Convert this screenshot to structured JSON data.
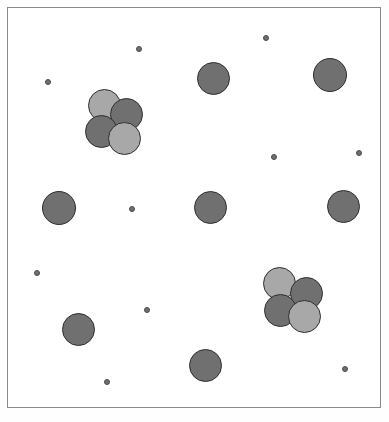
{
  "scene": {
    "title": "Particle Aggregation Scene",
    "canvas": {
      "width": 389,
      "height": 422,
      "background_color": "#ffffff",
      "border_color": "#8a8a8a",
      "border_width": 1,
      "frame": {
        "x": 7,
        "y": 7,
        "width": 374,
        "height": 401
      }
    },
    "palette": {
      "large_dark": "#707070",
      "large_light": "#a8a8a8",
      "small_dot": "#6e6e6e",
      "outline_large": "#2e2e2e",
      "outline_small": "#4a4a4a"
    },
    "legend": {
      "large_particle_label": "large particle",
      "light_particle_label": "light particle",
      "small_particle_label": "small particle",
      "cluster_label": "cluster"
    },
    "counts": {
      "large_particles": 15,
      "small_particles": 10,
      "clusters": 2,
      "total": 25
    }
  },
  "particles": [
    {
      "name": "large-particle-1",
      "kind": "large",
      "shade": "dark",
      "cx": 213,
      "cy": 78,
      "r": 16.5,
      "color": "#707070"
    },
    {
      "name": "large-particle-2",
      "kind": "large",
      "shade": "dark",
      "cx": 330,
      "cy": 75,
      "r": 17.0,
      "color": "#707070"
    },
    {
      "name": "large-particle-3",
      "kind": "large",
      "shade": "dark",
      "cx": 59,
      "cy": 208,
      "r": 17.0,
      "color": "#707070"
    },
    {
      "name": "large-particle-4",
      "kind": "large",
      "shade": "dark",
      "cx": 210,
      "cy": 207,
      "r": 16.5,
      "color": "#707070"
    },
    {
      "name": "large-particle-5",
      "kind": "large",
      "shade": "dark",
      "cx": 343,
      "cy": 206,
      "r": 16.5,
      "color": "#707070"
    },
    {
      "name": "large-particle-6",
      "kind": "large",
      "shade": "dark",
      "cx": 78,
      "cy": 329,
      "r": 16.5,
      "color": "#707070"
    },
    {
      "name": "large-particle-7",
      "kind": "large",
      "shade": "dark",
      "cx": 205,
      "cy": 365,
      "r": 16.5,
      "color": "#707070"
    },
    {
      "name": "cluster-1-particle-a",
      "kind": "large",
      "shade": "light",
      "cx": 104,
      "cy": 105,
      "r": 16.5,
      "color": "#a8a8a8",
      "cluster": 1
    },
    {
      "name": "cluster-1-particle-b",
      "kind": "large",
      "shade": "dark",
      "cx": 126,
      "cy": 114,
      "r": 16.5,
      "color": "#707070",
      "cluster": 1
    },
    {
      "name": "cluster-1-particle-c",
      "kind": "large",
      "shade": "dark",
      "cx": 101,
      "cy": 131,
      "r": 16.5,
      "color": "#707070",
      "cluster": 1
    },
    {
      "name": "cluster-1-particle-d",
      "kind": "large",
      "shade": "light",
      "cx": 124,
      "cy": 138,
      "r": 16.5,
      "color": "#a8a8a8",
      "cluster": 1
    },
    {
      "name": "cluster-2-particle-a",
      "kind": "large",
      "shade": "light",
      "cx": 279,
      "cy": 283,
      "r": 16.5,
      "color": "#a8a8a8",
      "cluster": 2
    },
    {
      "name": "cluster-2-particle-b",
      "kind": "large",
      "shade": "dark",
      "cx": 306,
      "cy": 293,
      "r": 16.5,
      "color": "#707070",
      "cluster": 2
    },
    {
      "name": "cluster-2-particle-c",
      "kind": "large",
      "shade": "dark",
      "cx": 280,
      "cy": 310,
      "r": 16.5,
      "color": "#707070",
      "cluster": 2
    },
    {
      "name": "cluster-2-particle-d",
      "kind": "large",
      "shade": "light",
      "cx": 304,
      "cy": 316,
      "r": 16.5,
      "color": "#a8a8a8",
      "cluster": 2
    },
    {
      "name": "small-particle-1",
      "kind": "small",
      "shade": "dark",
      "cx": 266,
      "cy": 38,
      "r": 3.0,
      "color": "#6e6e6e"
    },
    {
      "name": "small-particle-2",
      "kind": "small",
      "shade": "dark",
      "cx": 139,
      "cy": 49,
      "r": 3.0,
      "color": "#6e6e6e"
    },
    {
      "name": "small-particle-3",
      "kind": "small",
      "shade": "dark",
      "cx": 48,
      "cy": 82,
      "r": 3.0,
      "color": "#6e6e6e"
    },
    {
      "name": "small-particle-4",
      "kind": "small",
      "shade": "dark",
      "cx": 274,
      "cy": 157,
      "r": 3.0,
      "color": "#6e6e6e"
    },
    {
      "name": "small-particle-5",
      "kind": "small",
      "shade": "dark",
      "cx": 359,
      "cy": 153,
      "r": 3.0,
      "color": "#6e6e6e"
    },
    {
      "name": "small-particle-6",
      "kind": "small",
      "shade": "dark",
      "cx": 132,
      "cy": 209,
      "r": 3.0,
      "color": "#6e6e6e"
    },
    {
      "name": "small-particle-7",
      "kind": "small",
      "shade": "dark",
      "cx": 37,
      "cy": 273,
      "r": 3.0,
      "color": "#6e6e6e"
    },
    {
      "name": "small-particle-8",
      "kind": "small",
      "shade": "dark",
      "cx": 147,
      "cy": 310,
      "r": 3.0,
      "color": "#6e6e6e"
    },
    {
      "name": "small-particle-9",
      "kind": "small",
      "shade": "dark",
      "cx": 107,
      "cy": 382,
      "r": 3.0,
      "color": "#6e6e6e"
    },
    {
      "name": "small-particle-10",
      "kind": "small",
      "shade": "dark",
      "cx": 345,
      "cy": 369,
      "r": 3.0,
      "color": "#6e6e6e"
    }
  ]
}
